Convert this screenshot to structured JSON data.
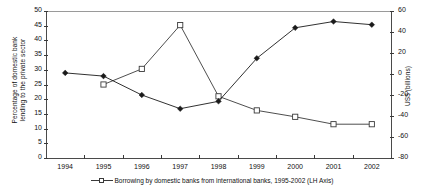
{
  "chart_data": {
    "type": "line",
    "title": "",
    "xlabel": "",
    "categories": [
      "1994",
      "1995",
      "1996",
      "1997",
      "1998",
      "1999",
      "2000",
      "2001",
      "2002"
    ],
    "grid": false,
    "legend_position": "bottom",
    "axes": {
      "left": {
        "label_line1": "Percentage of domestic bank",
        "label_line2": "lending to the private sector",
        "ticks": [
          "50",
          "45",
          "40",
          "35",
          "30",
          "25",
          "20",
          "15",
          "10",
          "5",
          "0"
        ],
        "tick_values": [
          50,
          45,
          40,
          35,
          30,
          25,
          20,
          15,
          10,
          5,
          0
        ],
        "ylim": [
          0,
          50
        ]
      },
      "right": {
        "label": "US$ (billions)",
        "ticks": [
          "60",
          "40",
          "20",
          "0",
          "-20",
          "-40",
          "-60",
          "-80"
        ],
        "tick_values": [
          60,
          40,
          20,
          0,
          -20,
          -40,
          -60,
          -80
        ],
        "ylim": [
          -80,
          60
        ]
      }
    },
    "series": [
      {
        "name": "Borrowing by domestic banks from international banks, 1995-2002 (LH Axis)",
        "axis": "left",
        "marker": "open-square",
        "color": "#3a3a3a",
        "x": [
          "1995",
          "1996",
          "1997",
          "1998",
          "1999",
          "2000",
          "2001",
          "2002"
        ],
        "values": [
          25.0,
          30.3,
          45.2,
          21.0,
          16.2,
          14.0,
          11.5,
          11.5
        ]
      },
      {
        "name": "Series 2 (RH Axis)",
        "axis": "right",
        "marker": "filled-diamond",
        "color": "#1a1a1a",
        "x": [
          "1994",
          "1995",
          "1996",
          "1997",
          "1998",
          "1999",
          "2000",
          "2001",
          "2002"
        ],
        "values": [
          1.0,
          -2.0,
          -20.0,
          -33.0,
          -26.0,
          15.0,
          44.0,
          50.0,
          47.0
        ]
      }
    ],
    "legend": [
      {
        "marker": "open-square",
        "label": "Borrowing by domestic banks from international banks, 1995-2002 (LH Axis)"
      }
    ]
  }
}
